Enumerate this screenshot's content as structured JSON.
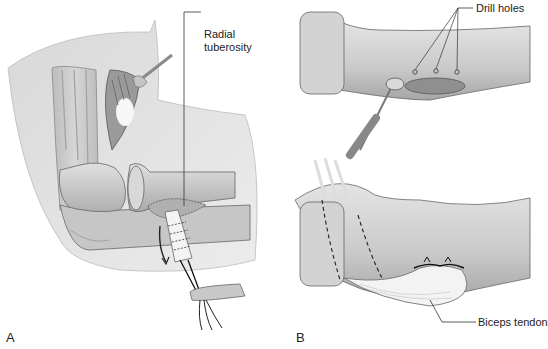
{
  "figure": {
    "panels": [
      {
        "id": "A",
        "letter": "A",
        "labels": [
          {
            "text_line1": "Radial",
            "text_line2": "tuberosity"
          }
        ]
      },
      {
        "id": "B",
        "letter": "B",
        "labels": [
          {
            "text": "Drill holes"
          },
          {
            "text": "Biceps tendon"
          }
        ]
      }
    ]
  },
  "colors": {
    "background": "#ffffff",
    "skin": "#e2e2e2",
    "bone": "#cfcfcf",
    "bone_shadow": "#a8a8a8",
    "tendon": "#f4f4f4",
    "outline": "#555555",
    "text": "#222222"
  }
}
